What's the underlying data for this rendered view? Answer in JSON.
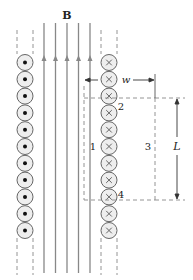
{
  "diagram": {
    "field_label": "B",
    "width_label": "w",
    "length_label": "L",
    "path_labels": [
      "1",
      "2",
      "3",
      "4"
    ],
    "left_column": {
      "current_direction": "out-of-page",
      "symbol": "dot",
      "count": 11
    },
    "right_column": {
      "current_direction": "into-page",
      "symbol": "cross",
      "count": 11
    },
    "field_lines": {
      "count": 5,
      "direction": "up"
    },
    "colors": {
      "line": "#555555",
      "field_line": "#888888",
      "circle_fill": "#eeeeee",
      "circle_stroke": "#666666",
      "dashed": "#888888"
    }
  }
}
